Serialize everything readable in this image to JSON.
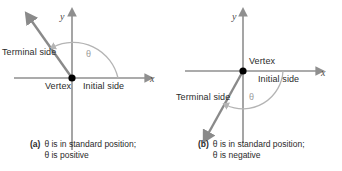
{
  "figure": {
    "panels": [
      {
        "id": "a",
        "tag": "(a)",
        "caption_line1": "θ is in standard position;",
        "caption_line2": "θ is positive",
        "axis_x_label": "x",
        "axis_y_label": "y",
        "vertex_label": "Vertex",
        "initial_side_label": "Initial side",
        "terminal_side_label": "Terminal side",
        "angle_label": "θ",
        "angle_direction": "counterclockwise",
        "angle_sign": "positive",
        "terminal_ray_direction": "upper-left"
      },
      {
        "id": "b",
        "tag": "(b)",
        "caption_line1": "θ is in standard position;",
        "caption_line2": "θ is negative",
        "axis_x_label": "x",
        "axis_y_label": "y",
        "vertex_label": "Vertex",
        "initial_side_label": "Initial side",
        "terminal_side_label": "Terminal side",
        "angle_label": "θ",
        "angle_direction": "clockwise",
        "angle_sign": "negative",
        "terminal_ray_direction": "lower-left"
      }
    ],
    "colors": {
      "axis": "#8f8f8f",
      "ray": "#8a8a8a",
      "arc": "#b4b4b4",
      "vertex": "#000000",
      "text": "#2b2b2b",
      "background": "#ffffff"
    }
  }
}
